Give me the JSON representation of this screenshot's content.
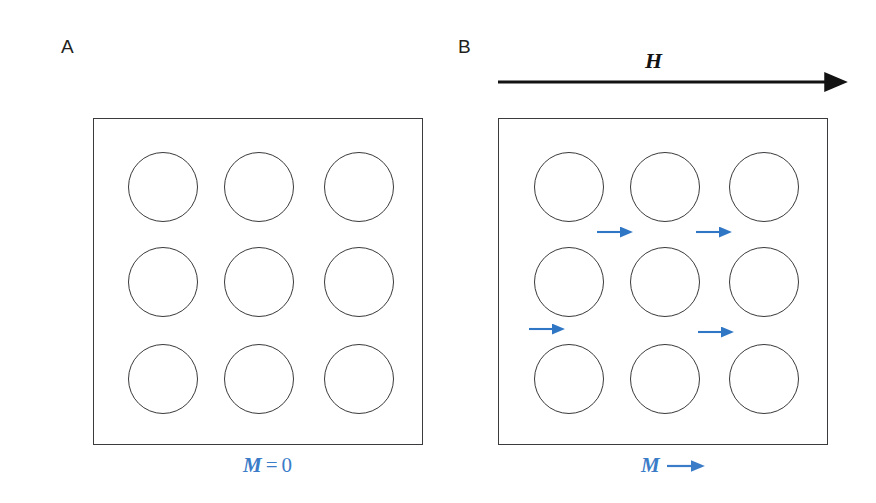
{
  "figure": {
    "width": 876,
    "height": 503,
    "background": "#ffffff",
    "type": "scientific-diagram"
  },
  "colors": {
    "outline": "#3b3b3d",
    "grain_outline": "#3a3a3c",
    "field_arrow": "#131313",
    "moment_arrow": "#2f76c4",
    "label_text": "#231f20",
    "magnetization_text": "#3a7cc8"
  },
  "panels": [
    {
      "id": "a",
      "label": "A",
      "label_position": {
        "x": 61,
        "y": 37
      },
      "box": {
        "x": 93,
        "y": 118,
        "width": 330,
        "height": 327
      },
      "grain_radius": 35,
      "grain_centers": [
        {
          "cx": 162,
          "cy": 186
        },
        {
          "cx": 258,
          "cy": 186
        },
        {
          "cx": 358,
          "cy": 186
        },
        {
          "cx": 162,
          "cy": 281
        },
        {
          "cx": 258,
          "cy": 281
        },
        {
          "cx": 358,
          "cy": 281
        },
        {
          "cx": 162,
          "cy": 378
        },
        {
          "cx": 258,
          "cy": 378
        },
        {
          "cx": 358,
          "cy": 378
        }
      ],
      "moment_arrows": [],
      "magnetization": {
        "symbol": "M",
        "relation": "=",
        "value": "0",
        "has_arrow": false,
        "position": {
          "x": 243,
          "y": 455
        }
      }
    },
    {
      "id": "b",
      "label": "B",
      "label_position": {
        "x": 458,
        "y": 37
      },
      "box": {
        "x": 498,
        "y": 118,
        "width": 330,
        "height": 327
      },
      "grain_radius": 35,
      "grain_centers": [
        {
          "cx": 568,
          "cy": 186
        },
        {
          "cx": 664,
          "cy": 186
        },
        {
          "cx": 763,
          "cy": 186
        },
        {
          "cx": 568,
          "cy": 281
        },
        {
          "cx": 664,
          "cy": 281
        },
        {
          "cx": 763,
          "cy": 281
        },
        {
          "cx": 568,
          "cy": 378
        },
        {
          "cx": 664,
          "cy": 378
        },
        {
          "cx": 763,
          "cy": 378
        }
      ],
      "moment_arrows": [
        {
          "x": 596,
          "y": 224,
          "direction": "right"
        },
        {
          "x": 695,
          "y": 224,
          "direction": "right"
        },
        {
          "x": 528,
          "y": 321,
          "direction": "right"
        },
        {
          "x": 697,
          "y": 324,
          "direction": "right"
        }
      ],
      "magnetization": {
        "symbol": "M",
        "relation": "",
        "value": "",
        "has_arrow": true,
        "position": {
          "x": 641,
          "y": 455
        }
      },
      "applied_field": {
        "symbol": "H",
        "symbol_position": {
          "x": 645,
          "y": 50
        },
        "arrow_start": {
          "x": 498,
          "y": 82
        },
        "arrow_end": {
          "x": 836,
          "y": 82
        },
        "direction": "right"
      }
    }
  ]
}
